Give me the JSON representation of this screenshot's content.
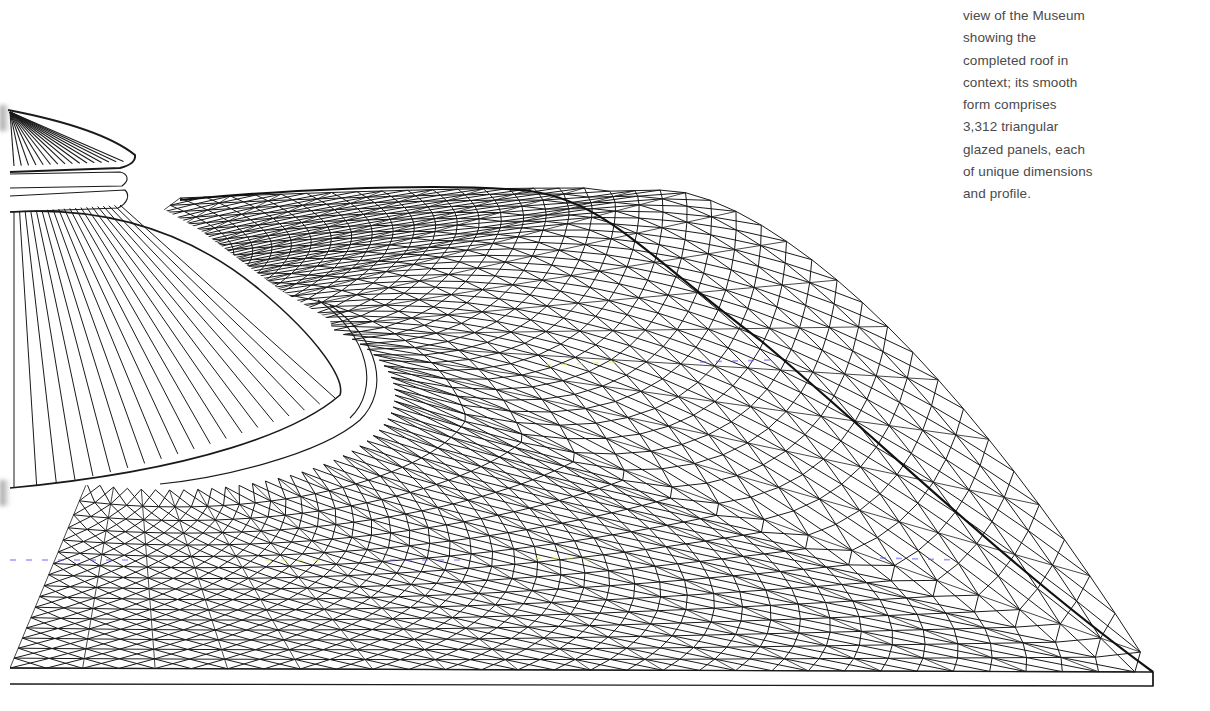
{
  "caption": {
    "lines": [
      "view of the Museum",
      "showing the",
      "completed roof in",
      "context; its smooth",
      "form comprises",
      "3,312 triangular",
      "glazed panels, each",
      "of unique dimensions",
      "and profile."
    ]
  },
  "figure": {
    "panel_count": "3,312",
    "line_color": "#1a1a1a",
    "background": "#ffffff",
    "caption_color": "#4a4a4a",
    "scan_artifact_colors": [
      "#5a5aff",
      "#e8e860"
    ]
  }
}
